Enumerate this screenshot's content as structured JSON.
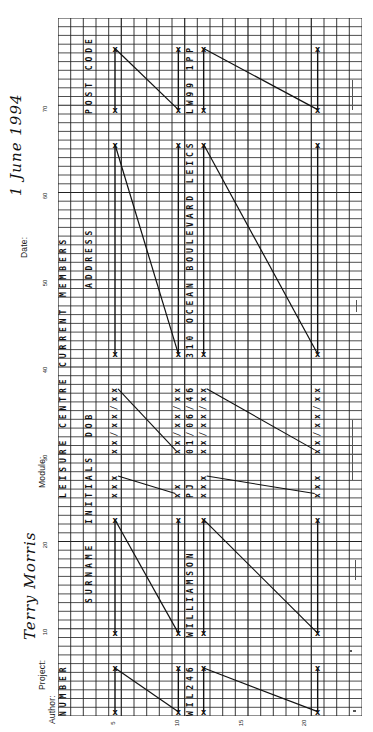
{
  "form": {
    "author_label": "Author:",
    "author_value": "Terry Morris",
    "project_label": "Project:",
    "module_label": "Module:",
    "date_label": "Date:",
    "date_value": "1 June 1994"
  },
  "axes": {
    "position_ticks": [
      "10",
      "20",
      "30",
      "40",
      "50",
      "60",
      "70"
    ],
    "line_ticks": [
      "5",
      "10",
      "15",
      "20"
    ]
  },
  "layout": {
    "title": "LEISURE CENTRE CURRENT MEMBERS",
    "fields": [
      {
        "name": "NUMBER",
        "start": 1,
        "length": 6,
        "template": "XXXXXX",
        "sample": "WIL246"
      },
      {
        "name": "SURNAME",
        "start": 10,
        "length": 14,
        "template": "X",
        "sample": "WILLIAMSON"
      },
      {
        "name": "INITIALS",
        "start": 26,
        "length": 3,
        "template": "XXX",
        "sample": "PJ"
      },
      {
        "name": "DOB",
        "start": 31,
        "length": 8,
        "template": "XX/XX/XX",
        "sample": "01/06/46"
      },
      {
        "name": "ADDRESS",
        "start": 42,
        "length": 25,
        "template": "X",
        "sample": "310 OCEAN BOULEVARD LEICS"
      },
      {
        "name": "POST CODE",
        "start": 70,
        "length": 8,
        "template": "X",
        "sample": "LW99 1PP"
      }
    ]
  },
  "grid_text": {
    "title_line": "LEISURE CENTRE CURRENT MEMBERS",
    "number_label": "NUMBER",
    "surname_label": "SURNAME",
    "initials_label": "INITIALS",
    "dob_label": "DOB",
    "address_label": "ADDRESS",
    "postcode_label": "POST CODE",
    "number_sample": "WIL246",
    "surname_sample": "WILLIAMSON",
    "initials_sample": "PJ",
    "dob_sample": "01/06/46",
    "address_sample": "310 OCEAN BOULEVARD LEICS",
    "postcode_sample": "LW99 1PP",
    "dob_template_a": "xx/xx/xx",
    "dob_template_b": "xx/xx/xx",
    "dob_template_c": "xx/xx/xx",
    "initials_template_a": "xxx",
    "initials_template_b": "xxx",
    "initials_template_c": "xx"
  }
}
